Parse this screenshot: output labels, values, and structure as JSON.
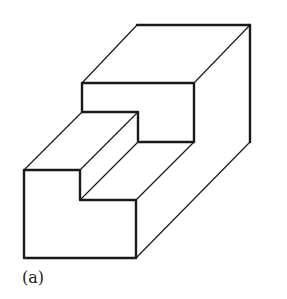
{
  "figure": {
    "label": "(a)",
    "stroke_color": "#1a1a1a",
    "background": "#ffffff"
  }
}
